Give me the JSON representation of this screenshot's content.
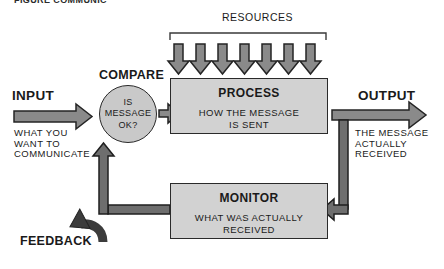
{
  "caption": {
    "text": "FIGURE  COMMUNIC"
  },
  "diagram": {
    "title_label": "RESOURCES",
    "nodes": {
      "input": {
        "label": "INPUT",
        "description": "WHAT YOU\nWANT TO\nCOMMUNICATE"
      },
      "compare": {
        "label": "COMPARE",
        "text": "IS\nMESSAGE\nOK?"
      },
      "process": {
        "title": "PROCESS",
        "subtitle": "HOW THE MESSAGE\nIS SENT"
      },
      "monitor": {
        "title": "MONITOR",
        "subtitle": "WHAT WAS ACTUALLY\nRECEIVED"
      },
      "output": {
        "label": "OUTPUT",
        "description": "THE MESSAGE\nACTUALLY\nRECEIVED"
      },
      "feedback": {
        "label": "FEEDBACK"
      }
    },
    "resource_arrow_count": 7,
    "colors": {
      "box_fill": "#d2d2d2",
      "circle_fill": "#c9c9c9",
      "arrow_fill": "#8a8a8a",
      "arrow_fill_dark": "#6e6e6e",
      "outline": "#242424",
      "text": "#1a1a1a",
      "page_background": "#ffffff"
    }
  }
}
